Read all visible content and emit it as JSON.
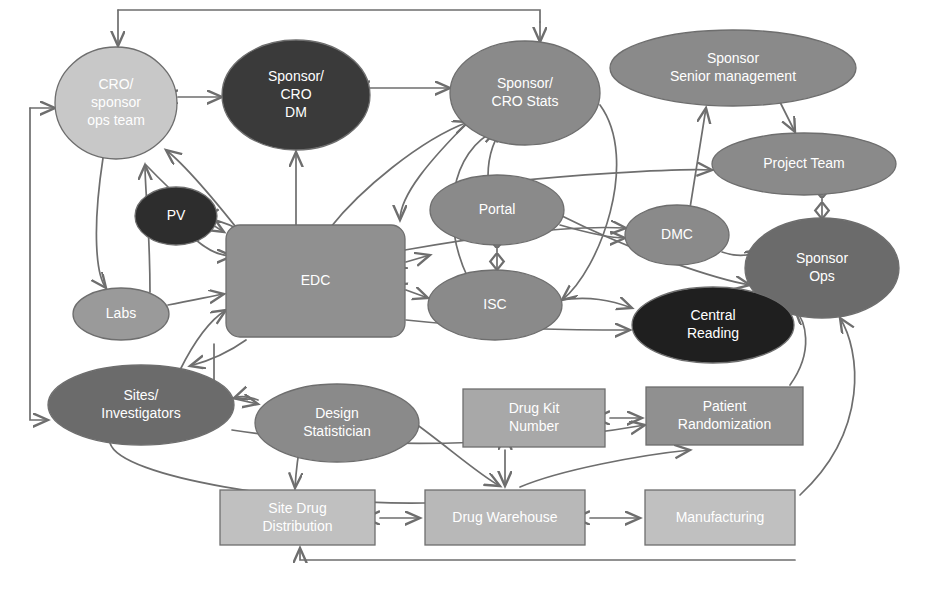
{
  "figure": {
    "caption": "",
    "background": "#ffffff",
    "edge_color": "#6e6e6e",
    "label_color": "#ffffff"
  },
  "palette": {
    "light": "#c8c8c8",
    "medium": "#8a8a8a",
    "dark": "#3a3a3a",
    "box_light": "#c0c0c0",
    "box_medium": "#909090",
    "stroke": "#6e6e6e"
  },
  "nodes": [
    {
      "id": "cro-sponsor-ops-team",
      "label": "CRO/\nsponsor\nops team",
      "shape": "ellipse",
      "cx": 116,
      "cy": 103,
      "rx": 61,
      "ry": 56,
      "fill": "#c8c8c8",
      "font_size": 14
    },
    {
      "id": "sponsor-cro-dm",
      "label": "Sponsor/\nCRO\nDM",
      "shape": "ellipse",
      "cx": 296,
      "cy": 95,
      "rx": 74,
      "ry": 55,
      "fill": "#3a3a3a",
      "font_size": 14
    },
    {
      "id": "sponsor-cro-stats",
      "label": "Sponsor/\nCRO Stats",
      "shape": "ellipse",
      "cx": 525,
      "cy": 93,
      "rx": 75,
      "ry": 52,
      "fill": "#8a8a8a",
      "font_size": 14
    },
    {
      "id": "sponsor-senior-management",
      "label": "Sponsor\nSenior management",
      "shape": "ellipse",
      "cx": 733,
      "cy": 68,
      "rx": 123,
      "ry": 38,
      "fill": "#8a8a8a",
      "font_size": 14
    },
    {
      "id": "project-team",
      "label": "Project Team",
      "shape": "ellipse",
      "cx": 804,
      "cy": 164,
      "rx": 92,
      "ry": 31,
      "fill": "#8a8a8a",
      "font_size": 14
    },
    {
      "id": "pv",
      "label": "PV",
      "shape": "ellipse",
      "cx": 176,
      "cy": 216,
      "rx": 41,
      "ry": 29,
      "fill": "#2d2d2d",
      "font_size": 14
    },
    {
      "id": "portal",
      "label": "Portal",
      "shape": "ellipse",
      "cx": 497,
      "cy": 210,
      "rx": 67,
      "ry": 35,
      "fill": "#8a8a8a",
      "font_size": 14
    },
    {
      "id": "dmc",
      "label": "DMC",
      "shape": "ellipse",
      "cx": 677,
      "cy": 235,
      "rx": 52,
      "ry": 30,
      "fill": "#8a8a8a",
      "font_size": 14
    },
    {
      "id": "sponsor-ops",
      "label": "Sponsor\nOps",
      "shape": "ellipse",
      "cx": 822,
      "cy": 268,
      "rx": 77,
      "ry": 50,
      "fill": "#6b6b6b",
      "font_size": 14
    },
    {
      "id": "edc",
      "label": "EDC",
      "shape": "roundrect",
      "x": 226,
      "y": 225,
      "w": 179,
      "h": 112,
      "r": 14,
      "fill": "#909090",
      "font_size": 14
    },
    {
      "id": "isc",
      "label": "ISC",
      "shape": "ellipse",
      "cx": 495,
      "cy": 305,
      "rx": 67,
      "ry": 35,
      "fill": "#8a8a8a",
      "font_size": 14
    },
    {
      "id": "labs",
      "label": "Labs",
      "shape": "ellipse",
      "cx": 121,
      "cy": 314,
      "rx": 48,
      "ry": 26,
      "fill": "#9a9a9a",
      "font_size": 14
    },
    {
      "id": "central-reading",
      "label": "Central\nReading",
      "shape": "ellipse",
      "cx": 713,
      "cy": 325,
      "rx": 81,
      "ry": 38,
      "fill": "#1f1f1f",
      "font_size": 14
    },
    {
      "id": "sites-investigators",
      "label": "Sites/\nInvestigators",
      "shape": "ellipse",
      "cx": 141,
      "cy": 405,
      "rx": 93,
      "ry": 40,
      "fill": "#6b6b6b",
      "font_size": 14
    },
    {
      "id": "design-statistician",
      "label": "Design\nStatistician",
      "shape": "ellipse",
      "cx": 337,
      "cy": 423,
      "rx": 82,
      "ry": 39,
      "fill": "#8a8a8a",
      "font_size": 14
    },
    {
      "id": "drug-kit-number",
      "label": "Drug Kit\nNumber",
      "shape": "rect",
      "x": 463,
      "y": 389,
      "w": 142,
      "h": 58,
      "fill": "#a8a8a8",
      "font_size": 14
    },
    {
      "id": "patient-randomization",
      "label": "Patient\nRandomization",
      "shape": "rect",
      "x": 646,
      "y": 387,
      "w": 157,
      "h": 58,
      "fill": "#909090",
      "font_size": 14
    },
    {
      "id": "site-drug-distribution",
      "label": "Site Drug\nDistribution",
      "shape": "rect",
      "x": 220,
      "y": 490,
      "w": 155,
      "h": 55,
      "fill": "#c0c0c0",
      "font_size": 14
    },
    {
      "id": "drug-warehouse",
      "label": "Drug Warehouse",
      "shape": "rect",
      "x": 425,
      "y": 490,
      "w": 160,
      "h": 55,
      "fill": "#b8b8b8",
      "font_size": 14
    },
    {
      "id": "manufacturing",
      "label": "Manufacturing",
      "shape": "rect",
      "x": 645,
      "y": 490,
      "w": 150,
      "h": 55,
      "fill": "#c0c0c0",
      "font_size": 14
    }
  ],
  "edges": [
    {
      "id": "e1",
      "from": "external-top",
      "to": "cro-sponsor-ops-team",
      "d": "M 118 10 L 540 10 L 540 22",
      "arrows": "none"
    },
    {
      "id": "e2",
      "from": "top-rail-left",
      "to": "cro-sponsor-ops-team",
      "d": "M 118 10 L 118 46",
      "arrows": "end"
    },
    {
      "id": "e3",
      "from": "top-rail-right",
      "to": "sponsor-cro-stats",
      "d": "M 540 22 L 540 42",
      "arrows": "end"
    },
    {
      "id": "e4",
      "from": "cro-sponsor-ops-team",
      "to": "sponsor-cro-dm",
      "d": "M 178 97 L 222 97",
      "arrows": "both"
    },
    {
      "id": "e5",
      "from": "sponsor-cro-dm",
      "to": "sponsor-cro-stats",
      "d": "M 370 88 L 450 88",
      "arrows": "both"
    },
    {
      "id": "e6",
      "from": "left-rail",
      "to": "cro-sponsor-ops-team",
      "d": "M 30 108 L 55 108",
      "arrows": "end"
    },
    {
      "id": "e7",
      "from": "left-rail-down",
      "to": "sites-investigators",
      "d": "M 30 108 L 30 420 L 48 420",
      "arrows": "end"
    },
    {
      "id": "e8",
      "from": "cro-sponsor-ops-team",
      "to": "labs",
      "d": "M 103 158 C 92 230 96 275 106 288",
      "arrows": "end"
    },
    {
      "id": "e9",
      "from": "labs",
      "to": "cro-sponsor-ops-team",
      "d": "M 150 292 C 150 230 145 190 145 165",
      "arrows": "end"
    },
    {
      "id": "e10",
      "from": "edc",
      "to": "cro-sponsor-ops-team",
      "d": "M 250 245 C 215 200 185 165 166 150",
      "arrows": "end"
    },
    {
      "id": "e11",
      "from": "edc",
      "to": "sponsor-cro-dm",
      "d": "M 296 226 L 296 152",
      "arrows": "end"
    },
    {
      "id": "e12",
      "from": "edc",
      "to": "pv",
      "d": "M 240 230 C 225 222 210 218 205 219",
      "arrows": "end"
    },
    {
      "id": "e13",
      "from": "pv",
      "to": "edc",
      "d": "M 196 240 C 210 252 222 256 232 256",
      "arrows": "end"
    },
    {
      "id": "e14",
      "from": "edc",
      "to": "sponsor-cro-stats",
      "d": "M 330 228 C 360 190 420 140 468 122",
      "arrows": "end"
    },
    {
      "id": "e15",
      "from": "portal",
      "to": "sponsor-cro-stats",
      "d": "M 488 176 C 488 155 495 135 505 128",
      "arrows": "end"
    },
    {
      "id": "e16",
      "from": "isc",
      "to": "sponsor-cro-stats",
      "d": "M 468 278 C 440 220 450 150 497 130",
      "arrows": "end"
    },
    {
      "id": "e17",
      "from": "portal",
      "to": "isc",
      "d": "M 497 245 L 497 270",
      "arrows": "diamond-both"
    },
    {
      "id": "e18",
      "from": "edc",
      "to": "portal",
      "d": "M 406 262 L 430 255",
      "arrows": "both"
    },
    {
      "id": "e19",
      "from": "edc",
      "to": "isc",
      "d": "M 406 290 L 428 298",
      "arrows": "both"
    },
    {
      "id": "e20",
      "from": "portal",
      "to": "dmc",
      "d": "M 560 225 C 595 235 615 238 625 238",
      "arrows": "end"
    },
    {
      "id": "e21",
      "from": "portal",
      "to": "project-team",
      "d": "M 470 186 C 560 175 680 168 712 170",
      "arrows": "end"
    },
    {
      "id": "e22",
      "from": "dmc",
      "to": "sponsor-senior-management",
      "d": "M 690 208 L 706 108",
      "arrows": "both"
    },
    {
      "id": "e23",
      "from": "sponsor-senior-management",
      "to": "project-team",
      "d": "M 780 102 L 795 132",
      "arrows": "end"
    },
    {
      "id": "e24",
      "from": "project-team",
      "to": "sponsor-ops",
      "d": "M 822 195 L 822 219",
      "arrows": "diamond-both"
    },
    {
      "id": "e25",
      "from": "dmc",
      "to": "sponsor-ops",
      "d": "M 722 252 C 740 258 752 255 760 250",
      "arrows": "end"
    },
    {
      "id": "e26",
      "from": "portal",
      "to": "sponsor-ops",
      "d": "M 560 215 C 640 255 720 280 750 285",
      "arrows": "end"
    },
    {
      "id": "e27",
      "from": "isc",
      "to": "central-reading",
      "d": "M 560 300 C 590 296 610 300 632 308",
      "arrows": "end"
    },
    {
      "id": "e28",
      "from": "edc",
      "to": "dmc",
      "d": "M 405 250 C 490 235 570 225 626 228",
      "arrows": "end"
    },
    {
      "id": "e29",
      "from": "sponsor-cro-stats",
      "to": "edc",
      "d": "M 470 120 C 430 160 400 195 400 220",
      "arrows": "end"
    },
    {
      "id": "e30",
      "from": "sites-investigators",
      "to": "edc",
      "d": "M 180 370 C 195 340 210 320 226 310",
      "arrows": "end"
    },
    {
      "id": "e31",
      "from": "edc",
      "to": "sites-investigators",
      "d": "M 246 340 C 225 355 205 362 190 366",
      "arrows": "end"
    },
    {
      "id": "e32",
      "from": "edc-bottom-rail",
      "to": "design-statistician",
      "d": "M 214 344 L 214 394 L 258 404",
      "arrows": "end"
    },
    {
      "id": "e33",
      "from": "design-statistician",
      "to": "sites-investigators",
      "d": "M 258 400 C 248 396 240 396 234 398",
      "arrows": "end"
    },
    {
      "id": "e34",
      "from": "design-statistician",
      "to": "site-drug-distribution",
      "d": "M 316 386 C 300 430 296 470 295 488",
      "arrows": "end"
    },
    {
      "id": "e35",
      "from": "design-statistician",
      "to": "drug-warehouse",
      "d": "M 360 388 C 420 420 470 470 500 486",
      "arrows": "end"
    },
    {
      "id": "e36",
      "from": "sites-investigators",
      "to": "drug-warehouse",
      "d": "M 110 443 C 120 478 300 505 425 503",
      "arrows": "none"
    },
    {
      "id": "e37",
      "from": "site-drug-distribution",
      "to": "drug-warehouse",
      "d": "M 380 518 L 420 518",
      "arrows": "both"
    },
    {
      "id": "e38",
      "from": "drug-warehouse",
      "to": "manufacturing",
      "d": "M 590 518 L 640 518",
      "arrows": "both"
    },
    {
      "id": "e39",
      "from": "drug-kit-number",
      "to": "patient-randomization",
      "d": "M 610 418 L 642 418",
      "arrows": "both"
    },
    {
      "id": "e40",
      "from": "drug-kit-number",
      "to": "drug-warehouse",
      "d": "M 505 450 L 505 486",
      "arrows": "both"
    },
    {
      "id": "e41",
      "from": "patient-randomization",
      "to": "sponsor-ops",
      "d": "M 790 385 C 815 350 805 320 795 310",
      "arrows": "end"
    },
    {
      "id": "e42",
      "from": "manufacturing",
      "to": "sponsor-ops",
      "d": "M 800 495 C 870 430 860 350 840 318",
      "arrows": "end"
    },
    {
      "id": "e43",
      "from": "manufacturing-rail",
      "to": "site-drug-distribution",
      "d": "M 795 560 L 300 560 L 300 548",
      "arrows": "end"
    },
    {
      "id": "e44",
      "from": "sites-investigators",
      "to": "patient-randomization",
      "d": "M 232 430 C 400 455 560 440 645 425",
      "arrows": "end"
    },
    {
      "id": "e45",
      "from": "drug-warehouse",
      "to": "patient-randomization",
      "d": "M 520 487 C 560 470 640 455 690 450",
      "arrows": "end"
    },
    {
      "id": "e46",
      "from": "central-reading",
      "to": "sponsor-ops",
      "d": "M 720 360 C 760 355 785 330 790 318",
      "arrows": "end"
    },
    {
      "id": "e47",
      "from": "edc",
      "to": "central-reading",
      "d": "M 406 320 C 500 330 580 330 630 330",
      "arrows": "end"
    },
    {
      "id": "e48",
      "from": "labs",
      "to": "edc",
      "d": "M 168 305 C 195 300 212 296 224 294",
      "arrows": "end"
    },
    {
      "id": "e49",
      "from": "sponsor-cro-stats-rail",
      "to": "isc",
      "d": "M 600 105 C 640 160 600 270 562 300",
      "arrows": "end"
    },
    {
      "id": "e50",
      "from": "cro-ops-edc",
      "to": "edc",
      "d": "M 146 165 C 175 195 200 218 224 232",
      "arrows": "end"
    }
  ]
}
